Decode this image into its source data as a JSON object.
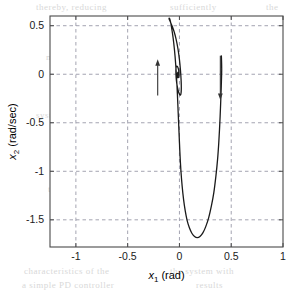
{
  "chart_data": {
    "type": "line",
    "title": "",
    "xlabel": "x_1 (rad)",
    "xlabel_var": "x",
    "xlabel_sub": "1",
    "xlabel_unit": "(rad)",
    "ylabel": "x_2 (rad/sec)",
    "ylabel_var": "x",
    "ylabel_sub": "2",
    "ylabel_unit": "(rad/sec)",
    "xlim": [
      -1.25,
      1.0
    ],
    "ylim": [
      -1.78,
      0.6
    ],
    "xticks": [
      -1,
      -0.5,
      0,
      0.5,
      1
    ],
    "xticklabels": [
      "-1",
      "-0.5",
      "0",
      "0.5",
      "1"
    ],
    "yticks": [
      0.5,
      0,
      -0.5,
      -1,
      -1.5
    ],
    "yticklabels": [
      "0.5",
      "0",
      "-0.5",
      "-1",
      "-1.5"
    ],
    "grid": true,
    "grid_style": "dashed",
    "grid_color": "#9a9aa8",
    "legend": null,
    "line_color": "#1a1a1a",
    "line_width": 1.3,
    "series": [
      {
        "name": "phase-trajectory",
        "description": "Inward spiral phase-plane trajectory converging to origin",
        "points": [
          [
            0.405,
            0.19
          ],
          [
            0.408,
            0.05
          ],
          [
            0.404,
            -0.12
          ],
          [
            0.398,
            -0.3
          ],
          [
            0.39,
            -0.5
          ],
          [
            0.38,
            -0.7
          ],
          [
            0.368,
            -0.88
          ],
          [
            0.352,
            -1.05
          ],
          [
            0.332,
            -1.22
          ],
          [
            0.308,
            -1.36
          ],
          [
            0.282,
            -1.48
          ],
          [
            0.254,
            -1.57
          ],
          [
            0.226,
            -1.635
          ],
          [
            0.198,
            -1.672
          ],
          [
            0.172,
            -1.683
          ],
          [
            0.146,
            -1.672
          ],
          [
            0.12,
            -1.638
          ],
          [
            0.096,
            -1.582
          ],
          [
            0.074,
            -1.505
          ],
          [
            0.056,
            -1.408
          ],
          [
            0.04,
            -1.292
          ],
          [
            0.026,
            -1.152
          ],
          [
            0.014,
            -0.99
          ],
          [
            0.004,
            -0.8
          ],
          [
            -0.004,
            -0.6
          ],
          [
            -0.012,
            -0.4
          ],
          [
            -0.02,
            -0.2
          ],
          [
            -0.03,
            0.0
          ],
          [
            -0.042,
            0.18
          ],
          [
            -0.056,
            0.33
          ],
          [
            -0.07,
            0.44
          ],
          [
            -0.082,
            0.52
          ],
          [
            -0.092,
            0.565
          ],
          [
            -0.098,
            0.578
          ],
          [
            -0.1,
            0.572
          ],
          [
            -0.09,
            0.545
          ],
          [
            -0.072,
            0.5
          ],
          [
            -0.052,
            0.44
          ],
          [
            -0.032,
            0.36
          ],
          [
            -0.014,
            0.26
          ],
          [
            0.0,
            0.15
          ],
          [
            0.01,
            0.04
          ],
          [
            0.016,
            -0.06
          ],
          [
            0.018,
            -0.14
          ],
          [
            0.016,
            -0.19
          ],
          [
            0.01,
            -0.215
          ],
          [
            0.0,
            -0.205
          ],
          [
            -0.012,
            -0.17
          ],
          [
            -0.022,
            -0.12
          ],
          [
            -0.03,
            -0.06
          ],
          [
            -0.034,
            0.01
          ],
          [
            -0.034,
            0.055
          ],
          [
            -0.03,
            0.078
          ],
          [
            -0.022,
            0.082
          ],
          [
            -0.014,
            0.068
          ],
          [
            -0.008,
            0.045
          ],
          [
            -0.004,
            0.018
          ],
          [
            -0.004,
            -0.008
          ],
          [
            -0.008,
            -0.028
          ],
          [
            -0.013,
            -0.036
          ],
          [
            -0.018,
            -0.03
          ],
          [
            -0.021,
            -0.014
          ],
          [
            -0.02,
            0.004
          ],
          [
            -0.016,
            0.017
          ],
          [
            -0.012,
            0.02
          ],
          [
            -0.009,
            0.014
          ],
          [
            -0.008,
            0.004
          ],
          [
            -0.01,
            -0.005
          ],
          [
            -0.013,
            -0.008
          ],
          [
            -0.015,
            -0.004
          ],
          [
            -0.014,
            0.004
          ],
          [
            -0.012,
            0.007
          ],
          [
            -0.011,
            0.003
          ],
          [
            -0.012,
            -0.002
          ],
          [
            -0.013,
            -0.001
          ],
          [
            -0.0125,
            0.001
          ],
          [
            -0.012,
            0.0
          ]
        ]
      }
    ],
    "annotations": [
      {
        "name": "direction-arrow-up",
        "type": "arrow",
        "direction": "up",
        "x": -0.21,
        "y_from": -0.22,
        "y_to": 0.155
      },
      {
        "name": "direction-arrow-down",
        "type": "arrow",
        "direction": "down",
        "x": 0.395,
        "y_from": 0.19,
        "y_to": -0.265
      }
    ]
  },
  "background_text": {
    "lines": [
      {
        "text": "thereby, reducing",
        "x": 36,
        "y": 2
      },
      {
        "text": "sufficiently",
        "x": 170,
        "y": 2
      },
      {
        "text": "the",
        "x": 266,
        "y": 2
      },
      {
        "text": "sliding mode",
        "x": 62,
        "y": 39
      },
      {
        "text": "conditions",
        "x": 186,
        "y": 39
      },
      {
        "text": "motion of the system is",
        "x": 46,
        "y": 52
      },
      {
        "text": "governed by",
        "x": 196,
        "y": 52
      },
      {
        "text": "system states",
        "x": 36,
        "y": 110
      },
      {
        "text": "the origin",
        "x": 184,
        "y": 110
      },
      {
        "text": "as the surface",
        "x": 70,
        "y": 140
      },
      {
        "text": "reaching",
        "x": 216,
        "y": 140
      },
      {
        "text": "the controller",
        "x": 48,
        "y": 184
      },
      {
        "text": "chattering",
        "x": 214,
        "y": 184
      },
      {
        "text": "characteristics of the",
        "x": 24,
        "y": 266
      },
      {
        "text": "the system with",
        "x": 170,
        "y": 266
      },
      {
        "text": "a simple PD controller",
        "x": 22,
        "y": 280
      },
      {
        "text": "results",
        "x": 196,
        "y": 280
      }
    ]
  }
}
